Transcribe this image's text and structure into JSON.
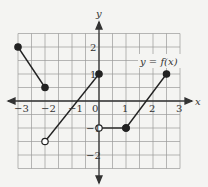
{
  "chart_data": {
    "type": "line",
    "title": "",
    "function_label": "y = f(x)",
    "xlabel": "x",
    "ylabel": "y",
    "xlim": [
      -3,
      3
    ],
    "ylim": [
      -2.5,
      2.5
    ],
    "grid": true,
    "grid_step": 0.5,
    "x_ticks": [
      "-3",
      "-2",
      "-1",
      "0",
      "1",
      "2",
      "3"
    ],
    "y_ticks": [
      "2",
      "1",
      "-1",
      "-2"
    ],
    "segments": [
      {
        "from": [
          -3,
          2
        ],
        "to": [
          -2,
          0.5
        ],
        "from_closed": true,
        "to_closed": true
      },
      {
        "from": [
          -2,
          -1.5
        ],
        "to": [
          0,
          1
        ],
        "from_closed": false,
        "to_closed": true
      },
      {
        "from": [
          0,
          -1
        ],
        "to": [
          1,
          -1
        ],
        "from_closed": false,
        "to_closed": true
      },
      {
        "from": [
          1,
          -1
        ],
        "to": [
          2.5,
          1
        ],
        "from_closed": true,
        "to_closed": true
      }
    ]
  },
  "labels": {
    "x_axis": "x",
    "y_axis": "y",
    "func": "y = f(x)",
    "xt": [
      "−3",
      "−2",
      "−1",
      "0",
      "1",
      "2",
      "3"
    ],
    "yt": [
      "2",
      "1",
      "−1",
      "−2"
    ]
  }
}
